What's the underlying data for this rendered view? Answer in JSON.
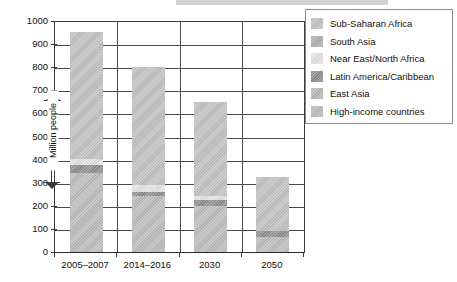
{
  "chart_data": {
    "type": "bar",
    "stacked": true,
    "title": "",
    "subtitle": "",
    "xlabel": "",
    "ylabel": "Million people",
    "ylim": [
      0,
      1000
    ],
    "ytick_step": 100,
    "yticks": [
      1000,
      900,
      800,
      700,
      600,
      500,
      400,
      300,
      200,
      100,
      0
    ],
    "ytick_labels": [
      "1000",
      "900",
      "800",
      "700",
      "600",
      "500",
      "400",
      "300",
      "200",
      "100",
      "0"
    ],
    "grid": true,
    "grid_axis": "both",
    "legend_position": "right",
    "categories": [
      "2005–2007",
      "2014–2016",
      "2030",
      "2050"
    ],
    "series": [
      {
        "name": "High-income countries",
        "color": "#bdbdbd",
        "values": [
          345,
          245,
          205,
          70
        ]
      },
      {
        "name": "Latin America/Caribbean",
        "color": "#8e8e8e",
        "values": [
          35,
          20,
          23,
          25
        ]
      },
      {
        "name": "Near East/North Africa",
        "color": "#e4e4e4",
        "values": [
          25,
          30,
          17,
          0
        ]
      },
      {
        "name": "East Asia",
        "color": "#b9b9b9",
        "values": [
          0,
          0,
          0,
          0
        ]
      },
      {
        "name": "South Asia",
        "color": "#b0b0b0",
        "values": [
          0,
          0,
          0,
          0
        ]
      },
      {
        "name": "Sub-Saharan Africa",
        "color": "#c2c2c2",
        "values": [
          550,
          510,
          410,
          235
        ]
      }
    ],
    "totals": [
      955,
      805,
      655,
      330
    ],
    "annotations": [
      {
        "name": "million-people-bracket",
        "text": "Million people",
        "from": 300,
        "to": 600,
        "style": "double-headed-arrow"
      }
    ]
  },
  "legend": {
    "items": [
      {
        "label": "Sub-Saharan Africa",
        "color": "#c2c2c2"
      },
      {
        "label": "South Asia",
        "color": "#b0b0b0"
      },
      {
        "label": "Near East/North Africa",
        "color": "#e4e4e4"
      },
      {
        "label": "Latin America/Caribbean",
        "color": "#8e8e8e"
      },
      {
        "label": "East Asia",
        "color": "#b9b9b9"
      },
      {
        "label": "High-income countries",
        "color": "#bdbdbd"
      }
    ]
  },
  "axes": {
    "y": {
      "labels": [
        "1000",
        "900",
        "800",
        "700",
        "600",
        "500",
        "400",
        "300",
        "200",
        "100",
        "0"
      ]
    },
    "x": {
      "labels": [
        "2005–2007",
        "2014–2016",
        "2030",
        "2050"
      ]
    }
  },
  "annotation": {
    "million_people": "Million people"
  },
  "colors": {
    "axis": "#3a3a3a",
    "grid": "#4a4a4a",
    "text": "#111111",
    "background": "#ffffff",
    "legend_border": "#8c8c8c"
  }
}
